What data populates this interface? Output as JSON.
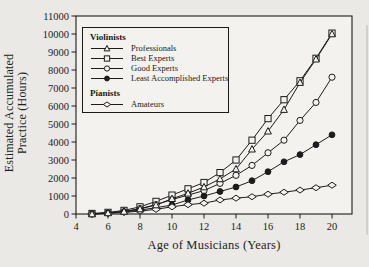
{
  "figure": {
    "xlabel": "Age of Musicians (Years)",
    "ylabel_line1": "Estimated Accumulated",
    "ylabel_line2": "Practice (Hours)"
  },
  "chart_data": {
    "type": "line",
    "title": "",
    "xlabel": "Age of Musicians (Years)",
    "ylabel": "Estimated Accumulated Practice (Hours)",
    "xlim": [
      4,
      21.25
    ],
    "ylim": [
      0,
      11000
    ],
    "x_ticks": [
      4,
      6,
      8,
      10,
      12,
      14,
      16,
      18,
      20
    ],
    "y_ticks": [
      0,
      1000,
      2000,
      3000,
      4000,
      5000,
      6000,
      7000,
      8000,
      9000,
      10000,
      11000
    ],
    "grid": false,
    "legend_position": "upper-left-inside",
    "x": [
      5,
      6,
      7,
      8,
      9,
      10,
      11,
      12,
      13,
      14,
      15,
      16,
      17,
      18,
      19,
      20
    ],
    "series": [
      {
        "name": "Professionals",
        "group": "Violinists",
        "marker": "triangle-open",
        "values": [
          0,
          60,
          140,
          280,
          500,
          850,
          1150,
          1500,
          1950,
          2500,
          3600,
          4600,
          5800,
          7300,
          8600,
          10000
        ]
      },
      {
        "name": "Best Experts",
        "group": "Violinists",
        "marker": "square-open",
        "values": [
          30,
          90,
          200,
          400,
          700,
          1050,
          1400,
          1750,
          2300,
          3000,
          4100,
          5300,
          6350,
          7400,
          8650,
          10050
        ]
      },
      {
        "name": "Good Experts",
        "group": "Violinists",
        "marker": "circle-open",
        "values": [
          0,
          60,
          130,
          300,
          520,
          800,
          1050,
          1300,
          1700,
          2150,
          2700,
          3400,
          4100,
          5200,
          6200,
          7600
        ]
      },
      {
        "name": "Least Accomplished Experts",
        "group": "Violinists",
        "marker": "circle-filled",
        "values": [
          0,
          50,
          110,
          220,
          350,
          500,
          780,
          1000,
          1250,
          1500,
          1850,
          2350,
          2900,
          3300,
          3850,
          4400
        ]
      },
      {
        "name": "Amateurs",
        "group": "Pianists",
        "marker": "diamond-open",
        "values": [
          0,
          40,
          90,
          160,
          260,
          400,
          520,
          600,
          780,
          880,
          960,
          1100,
          1210,
          1330,
          1460,
          1600
        ]
      }
    ],
    "legend_groups": [
      {
        "title": "Violinists",
        "series_indexes": [
          0,
          1,
          2,
          3
        ]
      },
      {
        "title": "Pianists",
        "series_indexes": [
          4
        ]
      }
    ]
  }
}
